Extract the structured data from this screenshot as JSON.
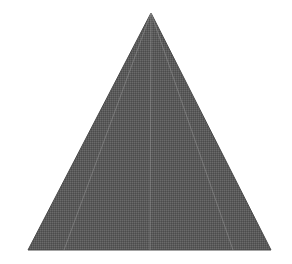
{
  "figure": {
    "shape": "triangle",
    "apex": [
      151,
      13
    ],
    "base_left": [
      28,
      250
    ],
    "base_right": [
      271,
      250
    ],
    "fill_color": "#5a5a5a",
    "edge_color": "#4a4a4a",
    "guide_color": "#9a9a9a",
    "guide_lines": [
      {
        "x1": 151,
        "y1": 13,
        "x2": 150,
        "y2": 250
      },
      {
        "x1": 151,
        "y1": 13,
        "x2": 64,
        "y2": 250
      },
      {
        "x1": 151,
        "y1": 13,
        "x2": 233,
        "y2": 250
      }
    ]
  }
}
